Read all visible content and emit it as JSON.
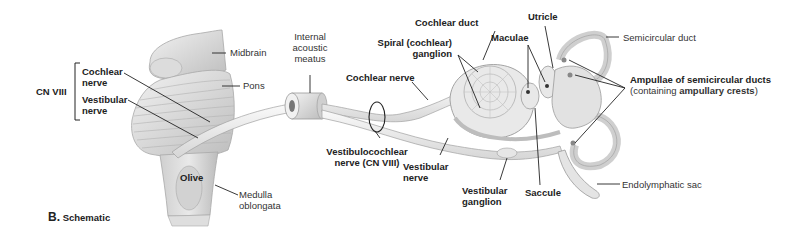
{
  "figure": {
    "caption_letter": "B.",
    "caption_text": "Schematic",
    "group_bracket_label": "CN VIII",
    "labels": {
      "midbrain": "Midbrain",
      "pons": "Pons",
      "olive": "Olive",
      "medulla_1": "Medulla",
      "medulla_2": "oblongata",
      "cochlear_nerve_left_1": "Cochlear",
      "cochlear_nerve_left_2": "nerve",
      "vestibular_nerve_left_1": "Vestibular",
      "vestibular_nerve_left_2": "nerve",
      "internal_acoustic_meatus_1": "Internal",
      "internal_acoustic_meatus_2": "acoustic",
      "internal_acoustic_meatus_3": "meatus",
      "cochlear_nerve_mid": "Cochlear nerve",
      "vestibulocochlear_1": "Vestibulocochlear",
      "vestibulocochlear_2": "nerve (CN VIII)",
      "vestibular_nerve_mid_1": "Vestibular",
      "vestibular_nerve_mid_2": "nerve",
      "cochlear_duct": "Cochlear duct",
      "spiral_ganglion_1": "Spiral (cochlear)",
      "spiral_ganglion_2": "ganglion",
      "vestibular_ganglion_1": "Vestibular",
      "vestibular_ganglion_2": "ganglion",
      "maculae": "Maculae",
      "utricle": "Utricle",
      "saccule": "Saccule",
      "semicircular_duct": "Semicircular duct",
      "ampullae_1": "Ampullae of semicircular ducts",
      "ampullae_2_pre": "(containing ",
      "ampullae_2_bold": "ampullary crests",
      "ampullae_2_post": ")",
      "endolymphatic_sac": "Endolymphatic sac"
    },
    "colors": {
      "tissue": "#e6e6e6",
      "tissue_shade": "#c9c9c9",
      "outline": "#9a9a9a",
      "leader": "#222222",
      "text": "#222222"
    }
  }
}
